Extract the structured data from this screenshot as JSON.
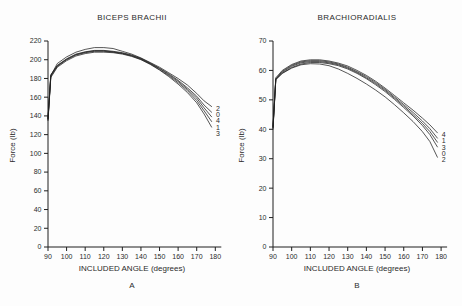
{
  "figure": {
    "background": "#fdfdfd",
    "curve_color": "#1f1f1f",
    "axis_color": "#1f1f1f",
    "text_color": "#2b2b2b"
  },
  "chart_data": [
    {
      "type": "line",
      "title": "BICEPS BRACHII",
      "xlabel": "INCLUDED ANGLE (degrees)",
      "ylabel": "Force (lb)",
      "panel_letter": "A",
      "xlim": [
        90,
        180
      ],
      "ylim": [
        0,
        220
      ],
      "xticks": [
        90,
        100,
        110,
        120,
        130,
        140,
        150,
        160,
        170,
        180
      ],
      "yticks": [
        0,
        20,
        40,
        60,
        80,
        100,
        120,
        140,
        160,
        180,
        200,
        220
      ],
      "grid": false,
      "legend_position": "line-end-labels",
      "x": [
        90,
        91.5,
        95,
        100,
        105,
        110,
        115,
        120,
        125,
        130,
        135,
        140,
        145,
        150,
        155,
        160,
        165,
        170,
        174,
        178
      ],
      "series": [
        {
          "name": "2",
          "values": [
            137,
            183,
            196,
            203,
            208,
            211,
            213,
            213,
            212,
            209,
            206,
            202,
            197,
            192,
            186,
            180,
            173,
            164,
            156,
            150
          ]
        },
        {
          "name": "0",
          "values": [
            137,
            183,
            194,
            201,
            206,
            208.5,
            210,
            210,
            209,
            207.5,
            205,
            201.5,
            196.5,
            191,
            185,
            178,
            170,
            161,
            151.5,
            144
          ]
        },
        {
          "name": "4",
          "values": [
            138,
            184,
            193.5,
            200.5,
            205.5,
            208,
            209.5,
            209.5,
            208.5,
            207,
            204.5,
            201,
            196,
            190.5,
            184,
            177,
            168.5,
            159,
            148.5,
            139
          ]
        },
        {
          "name": "1",
          "values": [
            136,
            182,
            193,
            200,
            205,
            207.5,
            209,
            209,
            208,
            206.5,
            204,
            200.5,
            195.5,
            189.5,
            183,
            175.5,
            167,
            156.5,
            145.5,
            134
          ]
        },
        {
          "name": "3",
          "values": [
            135,
            181,
            192,
            199,
            204,
            206.5,
            208,
            208,
            207.5,
            206,
            203.5,
            200,
            195,
            189,
            182,
            174,
            165,
            154,
            142,
            128
          ]
        }
      ],
      "end_label_order": [
        "2",
        "0",
        "4",
        "1",
        "3"
      ]
    },
    {
      "type": "line",
      "title": "BRACHIORADIALIS",
      "xlabel": "INCLUDED ANGLE (degrees)",
      "ylabel": "Force (lb)",
      "panel_letter": "B",
      "xlim": [
        90,
        180
      ],
      "ylim": [
        0,
        70
      ],
      "xticks": [
        90,
        100,
        110,
        120,
        130,
        140,
        150,
        160,
        170,
        180
      ],
      "yticks": [
        0,
        10,
        20,
        30,
        40,
        50,
        60,
        70
      ],
      "grid": false,
      "legend_position": "line-end-labels",
      "x": [
        90,
        91.5,
        95,
        100,
        105,
        110,
        115,
        120,
        125,
        130,
        135,
        140,
        145,
        150,
        155,
        160,
        165,
        170,
        174,
        178
      ],
      "series": [
        {
          "name": "4",
          "values": [
            41,
            57.5,
            60,
            62,
            63.2,
            63.6,
            63.6,
            63.2,
            62.5,
            61.5,
            60,
            58.3,
            56.3,
            54,
            51.5,
            49,
            46.5,
            43.8,
            41.5,
            38.8
          ]
        },
        {
          "name": "1",
          "values": [
            40.5,
            57,
            59.7,
            61.7,
            62.9,
            63.3,
            63.3,
            62.9,
            62.2,
            61.1,
            59.6,
            57.9,
            55.9,
            53.6,
            51,
            48.4,
            45.7,
            42.8,
            40.2,
            37
          ]
        },
        {
          "name": "3",
          "values": [
            41,
            57.2,
            59.4,
            61.4,
            62.6,
            63,
            63,
            62.6,
            61.9,
            60.8,
            59.3,
            57.5,
            55.5,
            53.2,
            50.6,
            47.9,
            45,
            42,
            39.2,
            35.6
          ]
        },
        {
          "name": "0",
          "values": [
            40,
            56.8,
            59.1,
            61,
            62.2,
            62.7,
            62.7,
            62.3,
            61.6,
            60.5,
            59,
            57.2,
            55.1,
            52.8,
            50.2,
            47.4,
            44.5,
            41.3,
            38.2,
            34
          ]
        },
        {
          "name": "2",
          "values": [
            40.5,
            57,
            59,
            60.8,
            61.9,
            62.3,
            62.2,
            61.6,
            60.5,
            59,
            57.3,
            55.4,
            53.3,
            51,
            48.4,
            45.6,
            42.6,
            39.2,
            35.8,
            30.5
          ]
        }
      ],
      "end_label_order": [
        "4",
        "1",
        "3",
        "0",
        "2"
      ]
    }
  ]
}
